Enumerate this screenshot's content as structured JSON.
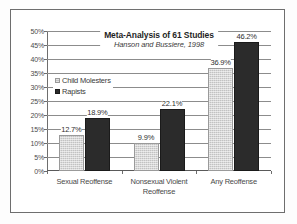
{
  "chart_data": {
    "type": "bar",
    "title": "Meta-Analysis of 61 Studies",
    "subtitle": "Hanson and Bussiere, 1998",
    "xlabel": "",
    "ylabel": "",
    "ylim": [
      0,
      50
    ],
    "ytick_labels": [
      "50%",
      "45%",
      "40%",
      "35%",
      "30%",
      "25%",
      "20%",
      "15%",
      "10%",
      "5%",
      "0%"
    ],
    "ytick_values": [
      50,
      45,
      40,
      35,
      30,
      25,
      20,
      15,
      10,
      5,
      0
    ],
    "grid": true,
    "legend_position": "inside-upper-left",
    "categories": [
      "Sexual Reoffense",
      "Nonsexual Violent Reoffense",
      "Any Reoffense"
    ],
    "series": [
      {
        "name": "Child Molesters",
        "color": "#c2c2c2",
        "values": [
          12.7,
          9.9,
          36.9
        ],
        "labels": [
          "12.7%",
          "9.9%",
          "36.9%"
        ]
      },
      {
        "name": "Rapists",
        "color": "#2b2b2b",
        "values": [
          18.9,
          22.1,
          46.2
        ],
        "labels": [
          "18.9%",
          "22.1%",
          "46.2%"
        ]
      }
    ]
  }
}
